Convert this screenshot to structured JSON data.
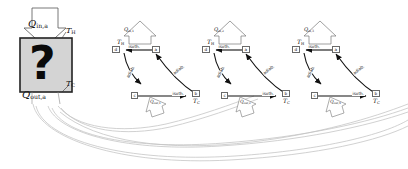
{
  "figure": {
    "type": "thermodynamic-cycle-diagram",
    "background": "#ffffff",
    "ink": "#111111",
    "faint_ink": "#b9b9b9",
    "box_fill": "#d4d4d4"
  },
  "blackbox": {
    "symbol": "?",
    "label_heat_in": "Q",
    "label_heat_in_sub": "in,a",
    "label_heat_out": "Q",
    "label_heat_out_sub": "out,a",
    "label_temp_hot": "T",
    "label_temp_hot_sub": "H",
    "label_temp_cold": "T",
    "label_temp_cold_sub": "C"
  },
  "cycles": [
    {
      "id": "cycle-1",
      "heat_in_label": "Q",
      "heat_in_sub": "in,1",
      "heat_out_label": "Q",
      "heat_out_sub": "out,1",
      "temp_hot": "T",
      "temp_hot_sub": "H",
      "temp_cold": "T",
      "temp_cold_sub": "C",
      "nodes": [
        {
          "name": "node-d",
          "label": "d"
        },
        {
          "name": "node-a",
          "label": "a"
        },
        {
          "name": "node-b",
          "label": "b"
        },
        {
          "name": "node-c",
          "label": "c"
        }
      ],
      "processes": [
        {
          "name": "isothermal-top",
          "label": "isoth."
        },
        {
          "name": "adiabatic-left",
          "label": "adiab."
        },
        {
          "name": "adiabatic-right",
          "label": "adiab."
        },
        {
          "name": "isothermal-bottom",
          "label": "isoth."
        }
      ]
    },
    {
      "id": "cycle-2",
      "heat_in_label": "Q",
      "heat_in_sub": "in,2",
      "heat_out_label": "Q",
      "heat_out_sub": "out,2",
      "temp_hot": "T",
      "temp_hot_sub": "H",
      "temp_cold": "T",
      "temp_cold_sub": "C",
      "nodes": [
        {
          "name": "node-d",
          "label": "d"
        },
        {
          "name": "node-a",
          "label": "a"
        },
        {
          "name": "node-b",
          "label": "b"
        },
        {
          "name": "node-c",
          "label": "c"
        }
      ],
      "processes": [
        {
          "name": "isothermal-top",
          "label": "isoth."
        },
        {
          "name": "adiabatic-left",
          "label": "adiab."
        },
        {
          "name": "adiabatic-right",
          "label": "adiab."
        },
        {
          "name": "isothermal-bottom",
          "label": "isoth."
        }
      ]
    },
    {
      "id": "cycle-3",
      "heat_in_label": "Q",
      "heat_in_sub": "in,3",
      "heat_out_label": "Q",
      "heat_out_sub": "out,3",
      "temp_hot": "T",
      "temp_hot_sub": "H",
      "temp_cold": "T",
      "temp_cold_sub": "C",
      "nodes": [
        {
          "name": "node-d",
          "label": "d"
        },
        {
          "name": "node-a",
          "label": "a"
        },
        {
          "name": "node-b",
          "label": "b"
        },
        {
          "name": "node-c",
          "label": "c"
        }
      ],
      "processes": [
        {
          "name": "isothermal-top",
          "label": "isoth."
        },
        {
          "name": "adiabatic-left",
          "label": "adiab."
        },
        {
          "name": "adiabatic-right",
          "label": "adiab."
        },
        {
          "name": "isothermal-bottom",
          "label": "isoth."
        }
      ]
    }
  ]
}
